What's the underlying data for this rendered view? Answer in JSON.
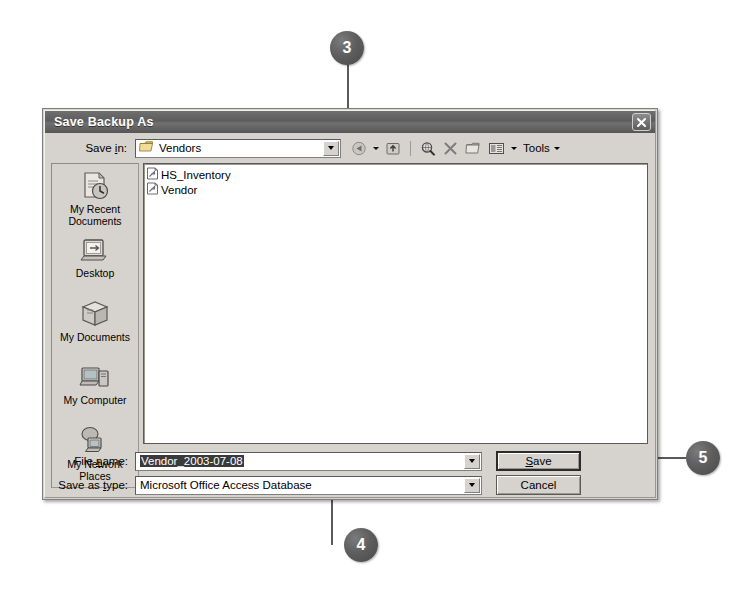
{
  "dialog": {
    "title": "Save Backup As",
    "close_icon": "close-icon",
    "save_in": {
      "label": "Save in:",
      "value": "Vendors",
      "folder_icon": "folder-icon",
      "dropdown_icon": "chevron-down-icon"
    },
    "toolbar": {
      "items": [
        {
          "name": "back-button",
          "icon": "back-arrow-icon"
        },
        {
          "name": "back-dropdown",
          "icon": "chevron-down-icon"
        },
        {
          "name": "up-one-level-button",
          "icon": "up-folder-icon"
        },
        {
          "name": "search-the-web-button",
          "icon": "search-globe-icon"
        },
        {
          "name": "delete-button",
          "icon": "x-delete-icon"
        },
        {
          "name": "new-folder-button",
          "icon": "new-folder-icon"
        },
        {
          "name": "views-button",
          "icon": "views-icon"
        },
        {
          "name": "views-dropdown",
          "icon": "chevron-down-icon"
        }
      ],
      "tools_label": "Tools",
      "tools_dropdown_icon": "chevron-down-icon"
    },
    "places": [
      {
        "label": "My Recent\nDocuments",
        "icon": "recent-documents-icon"
      },
      {
        "label": "Desktop",
        "icon": "desktop-icon"
      },
      {
        "label": "My Documents",
        "icon": "my-documents-icon"
      },
      {
        "label": "My Computer",
        "icon": "my-computer-icon"
      },
      {
        "label": "My Network\nPlaces",
        "icon": "network-places-icon"
      }
    ],
    "files": [
      {
        "name": "HS_Inventory",
        "icon": "access-database-icon"
      },
      {
        "name": "Vendor",
        "icon": "access-database-icon"
      }
    ],
    "file_name": {
      "label_pre": "File ",
      "label_accel": "n",
      "label_post": "ame:",
      "value": "Vendor_2003-07-08",
      "dropdown_icon": "chevron-down-icon"
    },
    "save_as_type": {
      "label_pre": "Save as ",
      "label_accel": "t",
      "label_post": "ype:",
      "value": "Microsoft Office Access Database",
      "dropdown_icon": "chevron-down-icon"
    },
    "buttons": {
      "save": {
        "pre": "",
        "accel": "S",
        "post": "ave"
      },
      "cancel": {
        "label": "Cancel"
      }
    }
  },
  "callouts": [
    {
      "number": "3",
      "target": "save-in-dropdown"
    },
    {
      "number": "4",
      "target": "file-name-field"
    },
    {
      "number": "5",
      "target": "save-button"
    }
  ],
  "colors": {
    "dialog_face": "#d6d3ce",
    "titlebar": "#5d5d5d",
    "callout": "#5e5e5e",
    "selection": "#3a3a3a"
  }
}
